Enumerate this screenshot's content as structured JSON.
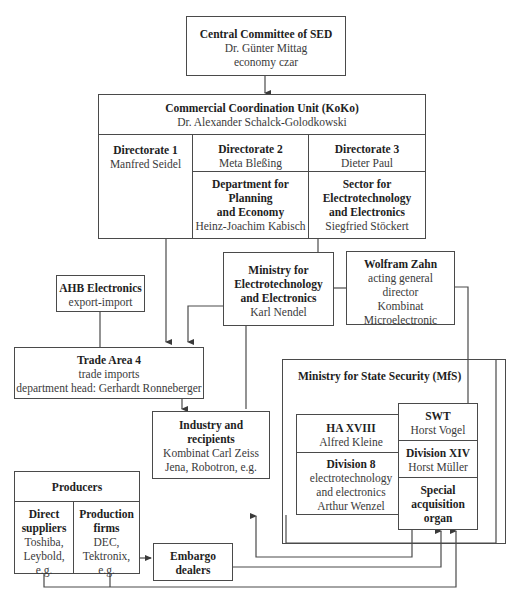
{
  "diagram": {
    "central_committee": {
      "title": "Central Committee of SED",
      "person": "Dr. Günter Mittag",
      "role": "economy czar"
    },
    "koko": {
      "title": "Commercial Coordination Unit (KoKo)",
      "person": "Dr. Alexander Schalck-Golodkowski",
      "directorate1": {
        "title": "Directorate 1",
        "person": "Manfred Seidel"
      },
      "directorate2": {
        "title": "Directorate 2",
        "person": "Meta Bleßing"
      },
      "directorate3": {
        "title": "Directorate 3",
        "person": "Dieter Paul"
      },
      "planning": {
        "title_line1": "Department for",
        "title_line2": "Planning",
        "title_line3": "and Economy",
        "person": "Heinz-Joachim Kabisch"
      },
      "sector": {
        "title_line1": "Sector for",
        "title_line2": "Electrotechnology",
        "title_line3": "and Electronics",
        "person": "Siegfried Stöckert"
      }
    },
    "ahb": {
      "title": "AHB Electronics",
      "subtitle": "export-import"
    },
    "ministry_electro": {
      "title_line1": "Ministry for",
      "title_line2": "Electrotechnology",
      "title_line3": "and Electronics",
      "person": "Karl Nendel"
    },
    "zahn": {
      "title": "Wolfram Zahn",
      "line1": "acting general",
      "line2": "director",
      "line3": "Kombinat",
      "line4": "Microelectronic"
    },
    "trade_area": {
      "title": "Trade Area 4",
      "line1": "trade imports",
      "line2": "department head: Gerhardt Ronneberger"
    },
    "industry": {
      "title_line1": "Industry and",
      "title_line2": "recipients",
      "line1": "Kombinat Carl Zeiss",
      "line2": "Jena, Robotron, e.g."
    },
    "mfs": {
      "title": "Ministry for State Security (MfS)",
      "ha18": {
        "title": "HA XVIII",
        "person": "Alfred Kleine"
      },
      "div8": {
        "title": "Division 8",
        "line1": "electrotechnology",
        "line2": "and electronics",
        "person": "Arthur Wenzel"
      },
      "swt": {
        "title": "SWT",
        "person": "Horst Vogel"
      },
      "div14": {
        "title": "Division XIV",
        "person": "Horst Müller"
      },
      "special": {
        "line1": "Special",
        "line2": "acquisition",
        "line3": "organ"
      }
    },
    "producers": {
      "title": "Producers",
      "direct": {
        "title_line1": "Direct",
        "title_line2": "suppliers",
        "line1": "Toshiba,",
        "line2": "Leybold,",
        "line3": "e.g."
      },
      "production": {
        "title_line1": "Production",
        "title_line2": "firms",
        "line1": "DEC,",
        "line2": "Tektronix,",
        "line3": "e.g."
      }
    },
    "embargo": {
      "line1": "Embargo",
      "line2": "dealers"
    },
    "colors": {
      "line": "#4a4a4a",
      "text": "#2a2a2a",
      "background": "#ffffff"
    }
  }
}
